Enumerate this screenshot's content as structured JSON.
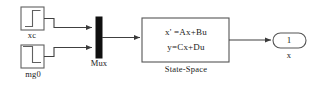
{
  "diagram": {
    "background_color": "#ffffff",
    "line_color": "#404040",
    "block_border_color": "#555555",
    "mux_color": "#101010",
    "text_color": "#1a1a1a"
  },
  "blocks": {
    "source_1": {
      "name": "xc",
      "type": "step-source",
      "waveform": "step-up"
    },
    "source_2": {
      "name": "mg0",
      "type": "step-source",
      "waveform": "step-down"
    },
    "mux": {
      "name": "Mux",
      "type": "mux",
      "input_count": 2,
      "output_count": 1
    },
    "state_space": {
      "name": "State-Space",
      "type": "state-space",
      "equation_line_1": "x' =Ax+Bu",
      "equation_line_2": "y=Cx+Du"
    },
    "output_port": {
      "name": "x",
      "type": "outport",
      "port_number": "1"
    }
  }
}
